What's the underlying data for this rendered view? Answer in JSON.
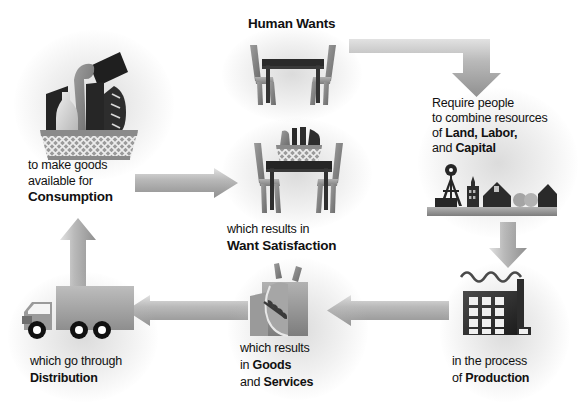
{
  "diagram": {
    "title": "Human Wants",
    "type": "circular-flow-cycle",
    "palette": {
      "arrow_light": "#d6d6d6",
      "arrow_mid": "#a8a8a8",
      "arrow_dark": "#8d8d8d",
      "ink_dark": "#2b2b2b",
      "ink_mid": "#6f6f6f",
      "ink_light": "#b5b5b5",
      "text": "#111111",
      "background": "#ffffff"
    },
    "nodes": [
      {
        "id": "human-wants",
        "icon": "table-and-chairs-icon",
        "title": "Human Wants",
        "caption_lines": []
      },
      {
        "id": "land-labor-capital",
        "icon": "farm-landscape-icon",
        "caption_lines": [
          [
            {
              "t": "Require people",
              "b": false
            }
          ],
          [
            {
              "t": "to combine resources",
              "b": false
            }
          ],
          [
            {
              "t": "of ",
              "b": false
            },
            {
              "t": "Land, Labor,",
              "b": true
            }
          ],
          [
            {
              "t": "and ",
              "b": false
            },
            {
              "t": "Capital",
              "b": true
            }
          ]
        ]
      },
      {
        "id": "production",
        "icon": "factory-icon",
        "caption_lines": [
          [
            {
              "t": "in the process",
              "b": false
            }
          ],
          [
            {
              "t": "of ",
              "b": false
            },
            {
              "t": "Production",
              "b": true
            }
          ]
        ]
      },
      {
        "id": "goods-and-services",
        "icon": "grocery-bag-icon",
        "caption_lines": [
          [
            {
              "t": "which results",
              "b": false
            }
          ],
          [
            {
              "t": "in ",
              "b": false
            },
            {
              "t": "Goods",
              "b": true
            }
          ],
          [
            {
              "t": "and ",
              "b": false
            },
            {
              "t": "Services",
              "b": true
            }
          ]
        ]
      },
      {
        "id": "distribution",
        "icon": "delivery-truck-icon",
        "caption_lines": [
          [
            {
              "t": "which go through",
              "b": false
            }
          ],
          [
            {
              "t": "Distribution",
              "b": true
            }
          ]
        ]
      },
      {
        "id": "consumption",
        "icon": "grocery-basket-icon",
        "caption_lines": [
          [
            {
              "t": "to make goods",
              "b": false
            }
          ],
          [
            {
              "t": "available for",
              "b": false
            }
          ],
          [
            {
              "t": "Consumption",
              "b": true
            }
          ]
        ]
      },
      {
        "id": "want-satisfaction",
        "icon": "table-with-basket-icon",
        "caption_lines": [
          [
            {
              "t": "which results in",
              "b": false
            }
          ],
          [
            {
              "t": "Want Satisfaction",
              "b": true
            }
          ]
        ]
      }
    ],
    "arrows": [
      {
        "id": "wants-to-resources",
        "shape": "elbow-right-down",
        "from": "human-wants",
        "to": "land-labor-capital"
      },
      {
        "id": "resources-to-production",
        "shape": "down",
        "from": "land-labor-capital",
        "to": "production"
      },
      {
        "id": "production-to-goods",
        "shape": "left",
        "from": "production",
        "to": "goods-and-services"
      },
      {
        "id": "goods-to-distribution",
        "shape": "left",
        "from": "goods-and-services",
        "to": "distribution"
      },
      {
        "id": "distribution-to-consumption",
        "shape": "up",
        "from": "distribution",
        "to": "consumption"
      },
      {
        "id": "consumption-to-satisfaction",
        "shape": "right",
        "from": "consumption",
        "to": "want-satisfaction"
      }
    ],
    "labels": {
      "human_wants": "Human Wants",
      "require_1": "Require people",
      "require_2": "to combine resources",
      "require_3_plain": "of ",
      "require_3_bold": "Land, Labor,",
      "require_4_plain": "and ",
      "require_4_bold": "Capital",
      "production_1": "in the process",
      "production_2_plain": "of ",
      "production_2_bold": "Production",
      "goods_1": "which results",
      "goods_2_plain": "in ",
      "goods_2_bold": "Goods",
      "goods_3_plain": "and ",
      "goods_3_bold": "Services",
      "distribution_1": "which go through",
      "distribution_2_bold": "Distribution",
      "consumption_1": "to make goods",
      "consumption_2": "available for",
      "consumption_3_bold": "Consumption",
      "satisfaction_1": "which results in",
      "satisfaction_2_bold": "Want Satisfaction"
    }
  }
}
